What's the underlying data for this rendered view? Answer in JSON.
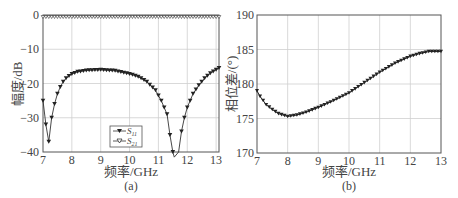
{
  "chart_data": [
    {
      "panel": "(a)",
      "type": "line",
      "xlabel": "频率/GHz",
      "ylabel": "幅度/dB",
      "xlim": [
        7,
        13.1
      ],
      "ylim": [
        -40,
        0
      ],
      "xticks": [
        "7",
        "8",
        "9",
        "10",
        "11",
        "12",
        "13"
      ],
      "yticks": [
        "0",
        "-10",
        "-20",
        "-30",
        "-40"
      ],
      "grid": true,
      "legend": {
        "position": "lower center",
        "entries": [
          "S11",
          "S21"
        ]
      },
      "series": [
        {
          "name": "S11",
          "marker": "filled-triangle-down",
          "x": [
            7.0,
            7.1,
            7.2,
            7.3,
            7.4,
            7.5,
            7.6,
            7.7,
            7.8,
            7.9,
            8.0,
            8.2,
            8.5,
            9.0,
            9.5,
            10.0,
            10.3,
            10.6,
            10.9,
            11.1,
            11.3,
            11.4,
            11.5,
            11.55,
            11.7,
            11.8,
            11.9,
            12.0,
            12.2,
            12.4,
            12.6,
            12.8,
            13.0,
            13.1
          ],
          "y": [
            -25,
            -32,
            -37,
            -30,
            -26,
            -23,
            -21,
            -19.5,
            -18.5,
            -17.8,
            -17.2,
            -16.6,
            -16.2,
            -16,
            -16.3,
            -17.2,
            -18,
            -19.5,
            -22,
            -25,
            -29,
            -35,
            -40,
            -42,
            -40,
            -34,
            -30,
            -27,
            -23,
            -20.5,
            -18.5,
            -17,
            -16,
            -15.5
          ]
        },
        {
          "name": "S21",
          "marker": "open-triangle-down",
          "x": [
            7.0,
            8.0,
            9.0,
            10.0,
            11.0,
            12.0,
            13.1
          ],
          "y": [
            -0.3,
            -0.3,
            -0.3,
            -0.3,
            -0.3,
            -0.3,
            -0.3
          ]
        }
      ],
      "caption": "(a)"
    },
    {
      "panel": "(b)",
      "type": "line",
      "xlabel": "频率/GHz",
      "ylabel": "相位差/(°)",
      "xlim": [
        7,
        13
      ],
      "ylim": [
        170,
        190
      ],
      "xticks": [
        "7",
        "8",
        "9",
        "10",
        "11",
        "12",
        "13"
      ],
      "yticks": [
        "190",
        "185",
        "180",
        "175",
        "170"
      ],
      "grid": true,
      "series": [
        {
          "name": "phase difference",
          "marker": "filled-triangle-down",
          "x": [
            7.0,
            7.1,
            7.3,
            7.5,
            7.7,
            8.0,
            8.3,
            8.6,
            9.0,
            9.5,
            10.0,
            10.5,
            11.0,
            11.5,
            12.0,
            12.3,
            12.6,
            13.0
          ],
          "y": [
            179,
            178.2,
            177,
            176.3,
            175.7,
            175.3,
            175.5,
            175.9,
            176.6,
            177.6,
            178.7,
            180.2,
            181.7,
            183,
            184,
            184.4,
            184.7,
            184.7
          ]
        }
      ],
      "caption": "(b)"
    }
  ]
}
